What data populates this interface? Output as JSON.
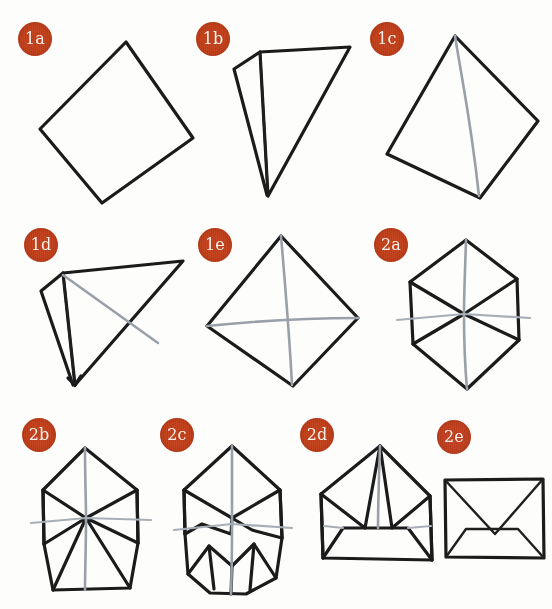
{
  "page": {
    "background_color": "#fdfdfc",
    "badge_color": "#c0411f",
    "badge_text_color": "#fdf3ec",
    "ink_color": "#1b1b1b",
    "crease_color": "#9aa0a8",
    "width": 552,
    "height": 609
  },
  "steps": [
    {
      "id": "1a",
      "label": "1a",
      "badge": {
        "x": 18,
        "y": 22
      },
      "caption": "Square sheet rotated to diamond orientation"
    },
    {
      "id": "1b",
      "label": "1b",
      "badge": {
        "x": 196,
        "y": 22
      },
      "caption": "Folded into a triangle with a narrow flap at left"
    },
    {
      "id": "1c",
      "label": "1c",
      "badge": {
        "x": 370,
        "y": 22
      },
      "caption": "Unfolded diamond showing one vertical crease"
    },
    {
      "id": "1d",
      "label": "1d",
      "badge": {
        "x": 24,
        "y": 228
      },
      "caption": "Folded triangle pointing right with diagonal crease"
    },
    {
      "id": "1e",
      "label": "1e",
      "badge": {
        "x": 198,
        "y": 228
      },
      "caption": "Unfolded diamond with both creases forming a cross"
    },
    {
      "id": "2a",
      "label": "2a",
      "badge": {
        "x": 374,
        "y": 228
      },
      "caption": "Hexagonal form with radial creases meeting at centre"
    },
    {
      "id": "2b",
      "label": "2b",
      "badge": {
        "x": 22,
        "y": 418
      },
      "caption": "Side corners folded in, flat top and bottom edges"
    },
    {
      "id": "2c",
      "label": "2c",
      "badge": {
        "x": 160,
        "y": 418
      },
      "caption": "Lower corners folded up forming extra creases"
    },
    {
      "id": "2d",
      "label": "2d",
      "badge": {
        "x": 300,
        "y": 418
      },
      "caption": "Bottom band folded up, pointed flap remains on top"
    },
    {
      "id": "2e",
      "label": "2e",
      "badge": {
        "x": 437,
        "y": 420
      },
      "caption": "Finished envelope with V-shaped front flap"
    }
  ]
}
